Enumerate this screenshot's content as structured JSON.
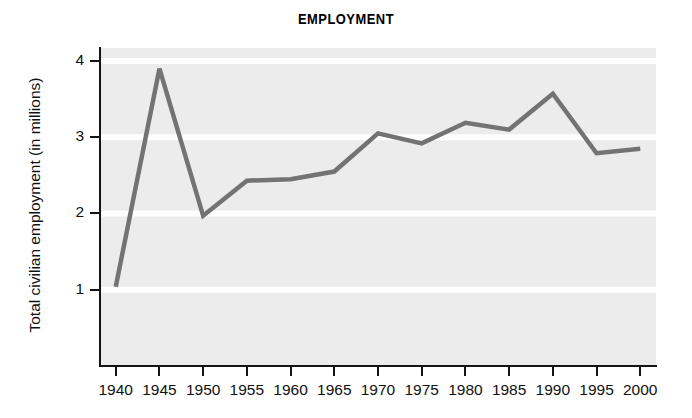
{
  "chart_data": {
    "type": "line",
    "title": "EMPLOYMENT",
    "xlabel": "",
    "ylabel": "Total civilian employment (in millions)",
    "categories": [
      "1940",
      "1945",
      "1950",
      "1955",
      "1960",
      "1965",
      "1970",
      "1975",
      "1980",
      "1985",
      "1990",
      "1995",
      "2000"
    ],
    "x": [
      1940,
      1945,
      1950,
      1955,
      1960,
      1965,
      1970,
      1975,
      1980,
      1985,
      1990,
      1995,
      2000
    ],
    "values": [
      1.04,
      3.9,
      1.97,
      2.43,
      2.45,
      2.55,
      3.05,
      2.92,
      3.19,
      3.1,
      3.57,
      2.79,
      2.85
    ],
    "series": [
      {
        "name": "Total civilian employment",
        "values": [
          1.04,
          3.9,
          1.97,
          2.43,
          2.45,
          2.55,
          3.05,
          2.92,
          3.19,
          3.1,
          3.57,
          2.79,
          2.85
        ]
      }
    ],
    "ylim": [
      0,
      4.17
    ],
    "xlim": [
      1938.2,
      2001.8
    ],
    "yticks": [
      1,
      2,
      3,
      4
    ],
    "ytick_labels": [
      "1",
      "2",
      "3",
      "4"
    ],
    "xticks": [
      1940,
      1945,
      1950,
      1955,
      1960,
      1965,
      1970,
      1975,
      1980,
      1985,
      1990,
      1995,
      2000
    ],
    "grid": {
      "horizontal": true,
      "vertical": false,
      "color": "#ffffff",
      "at": [
        1,
        2,
        3,
        4
      ]
    },
    "legend": {
      "visible": false,
      "position": "none"
    },
    "colors": {
      "line": "#737373",
      "plot_background": "#ececec",
      "figure_background": "#ffffff",
      "axis": "#141414",
      "text": "#111111",
      "gridline": "#ffffff"
    },
    "line_width": 4.5,
    "markers": false
  }
}
